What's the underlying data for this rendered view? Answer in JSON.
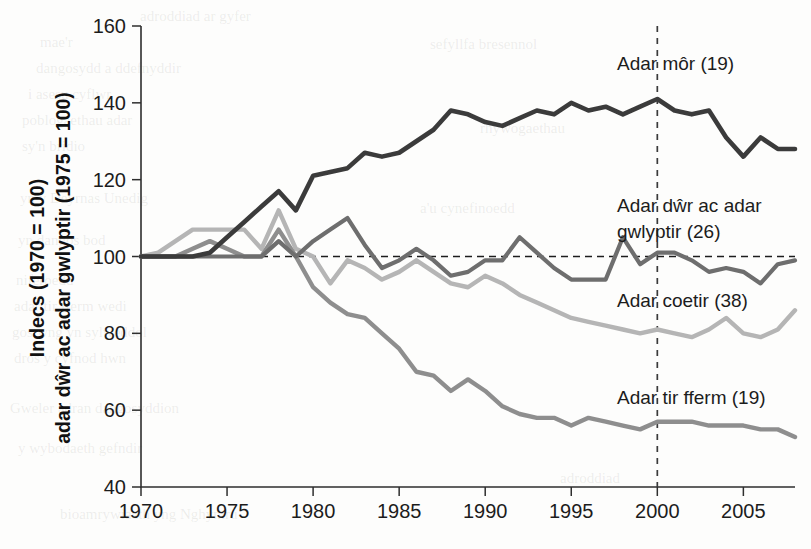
{
  "chart_data": {
    "type": "line",
    "title": "",
    "xlabel": "",
    "ylabel_line1": "Indecs (1970 = 100)",
    "ylabel_line2": "adar dŵr ac adar gwlyptir (1975 = 100)",
    "xlim": [
      1970,
      2008
    ],
    "ylim": [
      40,
      160
    ],
    "yticks": [
      40,
      60,
      80,
      100,
      120,
      140,
      160
    ],
    "ytick_labels": [
      "40",
      "60",
      "80",
      "100",
      "120",
      "140",
      "160"
    ],
    "xticks": [
      1970,
      1975,
      1980,
      1985,
      1990,
      1995,
      2000,
      2005
    ],
    "xtick_labels": [
      "1970",
      "1975",
      "1980",
      "1985",
      "1990",
      "1995",
      "2000",
      "2005"
    ],
    "grid": false,
    "legend_position": "inline-right",
    "reference_lines": [
      {
        "name": "baseline-100",
        "orientation": "horizontal",
        "value": 100,
        "style": "dashed"
      },
      {
        "name": "year-2000",
        "orientation": "vertical",
        "value": 2000,
        "style": "dashed"
      }
    ],
    "x": [
      1970,
      1971,
      1972,
      1973,
      1974,
      1975,
      1976,
      1977,
      1978,
      1979,
      1980,
      1981,
      1982,
      1983,
      1984,
      1985,
      1986,
      1987,
      1988,
      1989,
      1990,
      1991,
      1992,
      1993,
      1994,
      1995,
      1996,
      1997,
      1998,
      1999,
      2000,
      2001,
      2002,
      2003,
      2004,
      2005,
      2006,
      2007,
      2008
    ],
    "series": [
      {
        "name": "Adar môr (19)",
        "label": "Adar môr (19)",
        "count": 19,
        "color": "#3b3b3b",
        "values": [
          100,
          100,
          100,
          100,
          101,
          105,
          109,
          113,
          117,
          112,
          121,
          122,
          123,
          127,
          126,
          127,
          130,
          133,
          138,
          137,
          135,
          134,
          136,
          138,
          137,
          140,
          138,
          139,
          137,
          139,
          141,
          138,
          137,
          138,
          131,
          126,
          131,
          128,
          128
        ]
      },
      {
        "name": "Adar dŵr ac adar gwlyptir (26)",
        "label_line1": "Adar dŵr ac adar",
        "label_line2": "gwlyptir (26)",
        "count": 26,
        "color": "#6e6e6e",
        "values": [
          100,
          100,
          100,
          100,
          100,
          100,
          100,
          100,
          104,
          100,
          104,
          107,
          110,
          103,
          97,
          99,
          102,
          99,
          95,
          96,
          99,
          99,
          105,
          101,
          97,
          94,
          94,
          94,
          105,
          98,
          101,
          101,
          99,
          96,
          97,
          96,
          93,
          98,
          99
        ]
      },
      {
        "name": "Adar coetir (38)",
        "label": "Adar coetir (38)",
        "count": 38,
        "color": "#b5b5b5",
        "values": [
          100,
          101,
          104,
          107,
          107,
          107,
          107,
          102,
          112,
          102,
          100,
          93,
          99,
          97,
          94,
          96,
          99,
          96,
          93,
          92,
          95,
          93,
          90,
          88,
          86,
          84,
          83,
          82,
          81,
          80,
          81,
          80,
          79,
          81,
          84,
          80,
          79,
          81,
          86
        ]
      },
      {
        "name": "Adar tir fferm (19)",
        "label": "Adar tir fferm (19)",
        "count": 19,
        "color": "#8e8e8e",
        "values": [
          100,
          100,
          100,
          102,
          104,
          102,
          100,
          100,
          107,
          100,
          92,
          88,
          85,
          84,
          80,
          76,
          70,
          69,
          65,
          68,
          65,
          61,
          59,
          58,
          58,
          56,
          58,
          57,
          56,
          55,
          57,
          57,
          57,
          56,
          56,
          56,
          55,
          55,
          53
        ]
      }
    ],
    "annotations": [
      {
        "name": "label-seabirds",
        "text": "Adar môr (19)",
        "x_px": 617,
        "y_px": 70
      },
      {
        "name": "label-waterbirds-1",
        "text": "Adar dŵr ac adar",
        "x_px": 617,
        "y_px": 212
      },
      {
        "name": "label-waterbirds-2",
        "text": "gwlyptir (26)",
        "x_px": 617,
        "y_px": 238
      },
      {
        "name": "label-woodland",
        "text": "Adar coetir (38)",
        "x_px": 617,
        "y_px": 307
      },
      {
        "name": "label-farmland",
        "text": "Adar tir fferm (19)",
        "x_px": 617,
        "y_px": 404
      }
    ]
  },
  "ghost_text": {
    "note": "faint show-through text from reverse page side",
    "lines": [
      {
        "text": "adroddiad ar gyfer",
        "x": 140,
        "y": 8
      },
      {
        "text": "mae'r",
        "x": 40,
        "y": 34
      },
      {
        "text": "dangosydd a ddefnyddir",
        "x": 36,
        "y": 60
      },
      {
        "text": "i asesu cyflwr",
        "x": 28,
        "y": 86
      },
      {
        "text": "poblogaethau adar",
        "x": 22,
        "y": 112
      },
      {
        "text": "sy'n bridio",
        "x": 22,
        "y": 138
      },
      {
        "text": "yn y Deyrnas Unedig",
        "x": 20,
        "y": 190
      },
      {
        "text": "yn dangos bod",
        "x": 18,
        "y": 232
      },
      {
        "text": "niferoedd",
        "x": 16,
        "y": 272
      },
      {
        "text": "adar tir fferm wedi",
        "x": 14,
        "y": 298
      },
      {
        "text": "gostwng yn sylweddol",
        "x": 12,
        "y": 324
      },
      {
        "text": "dros y cyfnod hwn",
        "x": 14,
        "y": 350
      },
      {
        "text": "Gweler adran dangosyddion",
        "x": 10,
        "y": 400
      },
      {
        "text": "y wybodaeth gefndir",
        "x": 18,
        "y": 440
      },
      {
        "text": "bioamrywiaeth yng Nghymru",
        "x": 60,
        "y": 506
      },
      {
        "text": "sefyllfa bresennol",
        "x": 430,
        "y": 36
      },
      {
        "text": "rhywogaethau",
        "x": 480,
        "y": 120
      },
      {
        "text": "a'u cynefinoedd",
        "x": 420,
        "y": 200
      },
      {
        "text": "adroddiad",
        "x": 560,
        "y": 470
      }
    ]
  }
}
